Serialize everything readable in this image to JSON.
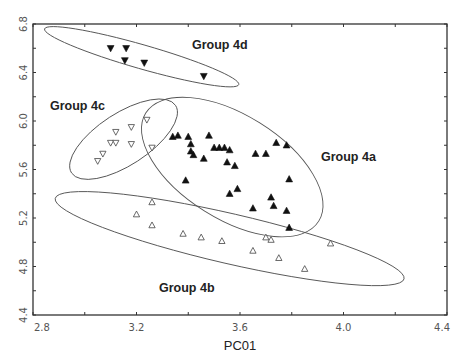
{
  "chart_data": {
    "type": "scatter",
    "title": "",
    "xlabel": "PC01",
    "ylabel": "",
    "xlim": [
      2.8,
      4.4
    ],
    "ylim": [
      4.4,
      6.8
    ],
    "x_ticks": [
      "2.8",
      "3.2",
      "3.6",
      "4.0",
      "4.4"
    ],
    "y_ticks": [
      "4.4",
      "4.8",
      "5.2",
      "5.6",
      "6.0",
      "6.4",
      "6.8"
    ],
    "grid": false,
    "legend": null,
    "series": [
      {
        "name": "Group 4a",
        "marker": "filled-triangle-up",
        "points": [
          [
            3.34,
            5.87
          ],
          [
            3.36,
            5.88
          ],
          [
            3.4,
            5.87
          ],
          [
            3.41,
            5.81
          ],
          [
            3.41,
            5.75
          ],
          [
            3.42,
            5.72
          ],
          [
            3.48,
            5.88
          ],
          [
            3.5,
            5.78
          ],
          [
            3.52,
            5.78
          ],
          [
            3.54,
            5.78
          ],
          [
            3.56,
            5.76
          ],
          [
            3.46,
            5.69
          ],
          [
            3.55,
            5.66
          ],
          [
            3.58,
            5.63
          ],
          [
            3.39,
            5.51
          ],
          [
            3.56,
            5.4
          ],
          [
            3.59,
            5.44
          ],
          [
            3.66,
            5.73
          ],
          [
            3.7,
            5.73
          ],
          [
            3.74,
            5.82
          ],
          [
            3.78,
            5.8
          ],
          [
            3.79,
            5.52
          ],
          [
            3.72,
            5.37
          ],
          [
            3.73,
            5.3
          ],
          [
            3.65,
            5.28
          ],
          [
            3.78,
            5.26
          ],
          [
            3.79,
            5.12
          ]
        ],
        "ellipse": {
          "cx": 3.57,
          "cy": 5.62,
          "rx_px": 102,
          "ry_px": 52,
          "rotation_deg": 32
        }
      },
      {
        "name": "Group 4b",
        "marker": "open-triangle-up",
        "points": [
          [
            3.2,
            5.23
          ],
          [
            3.26,
            5.33
          ],
          [
            3.26,
            5.14
          ],
          [
            3.38,
            5.07
          ],
          [
            3.45,
            5.04
          ],
          [
            3.53,
            5.01
          ],
          [
            3.65,
            4.93
          ],
          [
            3.7,
            5.04
          ],
          [
            3.72,
            5.02
          ],
          [
            3.75,
            4.87
          ],
          [
            3.85,
            4.78
          ],
          [
            3.95,
            4.99
          ]
        ],
        "ellipse": {
          "cx": 3.56,
          "cy": 5.03,
          "rx_px": 179,
          "ry_px": 25,
          "rotation_deg": 13
        }
      },
      {
        "name": "Group 4c",
        "marker": "open-triangle-down",
        "points": [
          [
            3.05,
            5.67
          ],
          [
            3.07,
            5.73
          ],
          [
            3.1,
            5.82
          ],
          [
            3.12,
            5.82
          ],
          [
            3.12,
            5.91
          ],
          [
            3.18,
            5.95
          ],
          [
            3.18,
            5.81
          ],
          [
            3.24,
            6.01
          ],
          [
            3.26,
            5.78
          ]
        ],
        "ellipse": {
          "cx": 3.15,
          "cy": 5.85,
          "rx_px": 62,
          "ry_px": 26,
          "rotation_deg": -33
        }
      },
      {
        "name": "Group 4d",
        "marker": "filled-triangle-down",
        "points": [
          [
            3.1,
            6.6
          ],
          [
            3.16,
            6.6
          ],
          [
            3.155,
            6.5
          ],
          [
            3.23,
            6.48
          ],
          [
            3.46,
            6.37
          ]
        ],
        "ellipse": {
          "cx": 3.22,
          "cy": 6.53,
          "rx_px": 101,
          "ry_px": 12,
          "rotation_deg": 16
        }
      }
    ],
    "annotations": [
      {
        "text": "Group 4d",
        "x": 3.46,
        "y": 6.67
      },
      {
        "text": "Group 4c",
        "x": 2.82,
        "y": 6.12
      },
      {
        "text": "Group 4a",
        "x": 3.91,
        "y": 5.69
      },
      {
        "text": "Group 4b",
        "x": 3.27,
        "y": 4.6
      }
    ]
  },
  "labels": {
    "xlabel": "PC01",
    "group_4a": "Group 4a",
    "group_4b": "Group 4b",
    "group_4c": "Group 4c",
    "group_4d": "Group 4d",
    "x_ticks": [
      "2.8",
      "3.2",
      "3.6",
      "4.0",
      "4.4"
    ],
    "y_ticks": [
      "4.4",
      "4.8",
      "5.2",
      "5.6",
      "6.0",
      "6.4",
      "6.8"
    ]
  },
  "colors": {
    "axis": "#333333",
    "marker": "#111111",
    "ellipse": "#555555",
    "tick_text": "#555555"
  }
}
